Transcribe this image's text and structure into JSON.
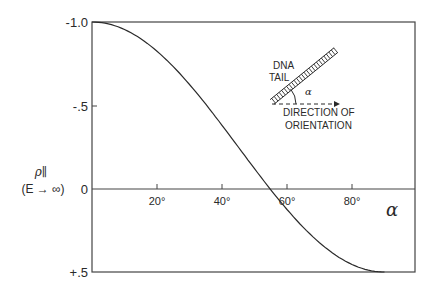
{
  "chart_data": {
    "type": "line",
    "title": "",
    "xlabel": "α",
    "ylabel": "ρ∥",
    "ylabel_sub": "(E → ∞)",
    "xlim": [
      0,
      90
    ],
    "ylim": [
      -1.0,
      0.5
    ],
    "y_inverted": true,
    "x_ticks": [
      20,
      40,
      60,
      80
    ],
    "x_tick_labels": [
      "20°",
      "40°",
      "60°",
      "80°"
    ],
    "y_ticks": [
      -1.0,
      -0.5,
      0,
      0.5
    ],
    "y_tick_labels": [
      "-1.0",
      "-.5",
      "0",
      "+.5"
    ],
    "grid": false,
    "legend": null,
    "series": [
      {
        "name": "ρ∥ = -(3cos²α - 1)/2",
        "x": [
          0,
          10,
          20,
          30,
          40,
          50,
          54.7,
          60,
          70,
          80,
          90
        ],
        "y": [
          -1.0,
          -0.955,
          -0.825,
          -0.625,
          -0.38,
          -0.12,
          0.0,
          0.125,
          0.325,
          0.455,
          0.5
        ]
      }
    ],
    "annotations": {
      "inset_labels": [
        "DNA",
        "TAIL"
      ],
      "inset_angle": "α",
      "inset_direction": [
        "DIRECTION OF",
        "ORIENTATION"
      ]
    }
  }
}
